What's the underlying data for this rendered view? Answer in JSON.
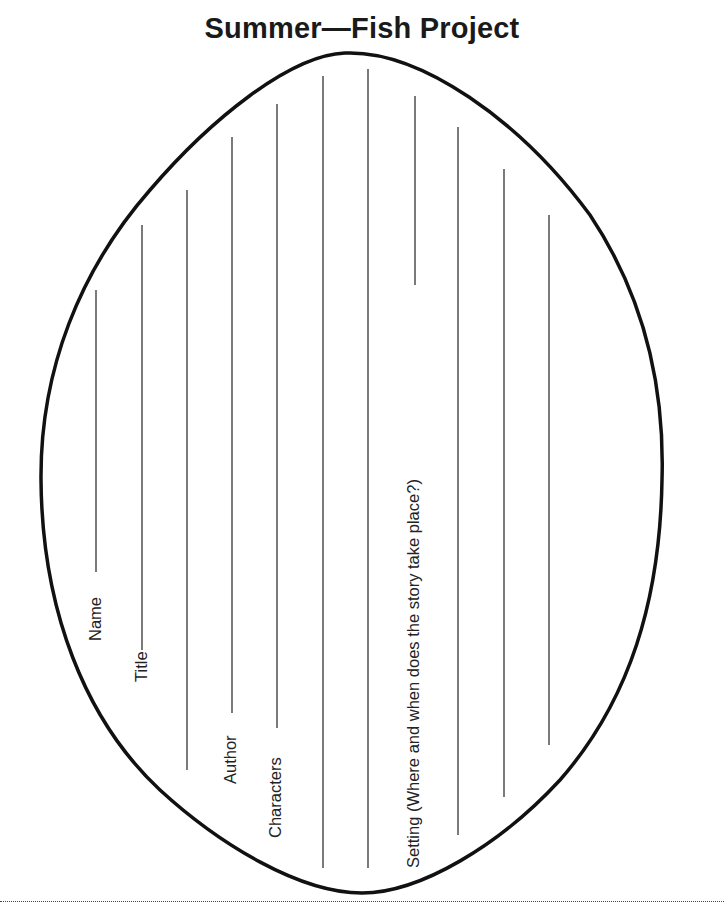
{
  "page": {
    "title": "Summer—Fish Project"
  },
  "fields": [
    {
      "label": "Name"
    },
    {
      "label": "Title"
    },
    {
      "label": "Author"
    },
    {
      "label": "Characters"
    },
    {
      "label": "Setting (Where and when does the story take place?)"
    }
  ],
  "colors": {
    "outline": "#111111",
    "writing_lines": "#333333",
    "background": "#ffffff"
  }
}
